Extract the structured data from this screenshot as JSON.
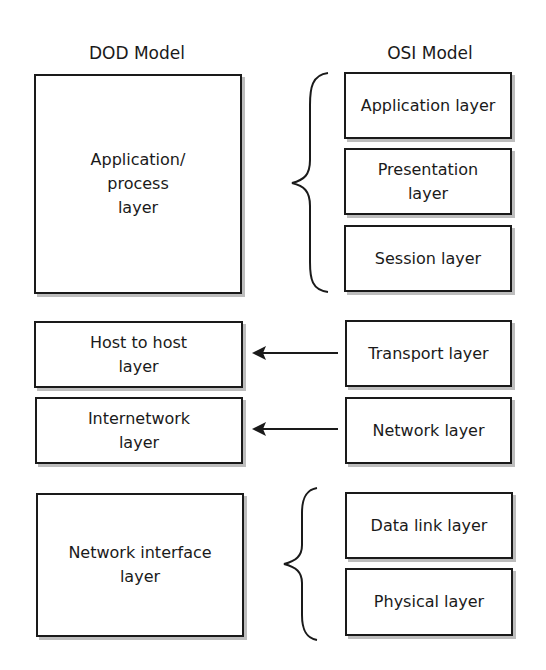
{
  "headings": {
    "dod": "DOD Model",
    "osi": "OSI Model"
  },
  "dod_layers": [
    {
      "label": "Application/\nprocess\nlayer"
    },
    {
      "label": "Host to host\nlayer"
    },
    {
      "label": "Internetwork\nlayer"
    },
    {
      "label": "Network interface\nlayer"
    }
  ],
  "osi_layers": [
    {
      "label": "Application layer"
    },
    {
      "label": "Presentation\nlayer"
    },
    {
      "label": "Session layer"
    },
    {
      "label": "Transport layer"
    },
    {
      "label": "Network layer"
    },
    {
      "label": "Data link layer"
    },
    {
      "label": "Physical layer"
    }
  ],
  "mappings": [
    {
      "osi": [
        "Application layer",
        "Presentation layer",
        "Session layer"
      ],
      "dod": "Application/process layer",
      "connector": "brace"
    },
    {
      "osi": [
        "Transport layer"
      ],
      "dod": "Host to host layer",
      "connector": "arrow"
    },
    {
      "osi": [
        "Network layer"
      ],
      "dod": "Internetwork layer",
      "connector": "arrow"
    },
    {
      "osi": [
        "Data link layer",
        "Physical layer"
      ],
      "dod": "Network interface layer",
      "connector": "brace"
    }
  ],
  "colors": {
    "stroke": "#1a1a1a",
    "shadow": "#bdbdbd",
    "background": "#ffffff"
  }
}
